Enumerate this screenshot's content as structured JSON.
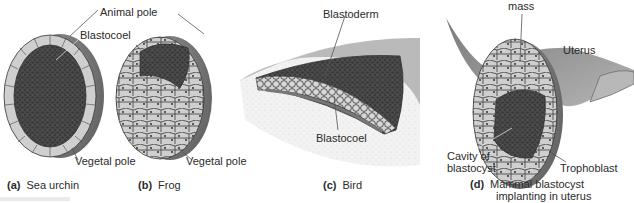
{
  "figure": {
    "panels": [
      {
        "id": "a",
        "caption_letter": "(a)",
        "caption_text": "Sea urchin",
        "labels": {
          "animal_pole": "Animal pole",
          "blastocoel": "Blastocoel",
          "vegetal_pole": "Vegetal pole"
        }
      },
      {
        "id": "b",
        "caption_letter": "(b)",
        "caption_text": "Frog",
        "labels": {
          "vegetal_pole": "Vegetal pole"
        }
      },
      {
        "id": "c",
        "caption_letter": "(c)",
        "caption_text": "Bird",
        "labels": {
          "blastoderm": "Blastoderm",
          "blastocoel": "Blastocoel"
        }
      },
      {
        "id": "d",
        "caption_letter": "(d)",
        "caption_text_line1": "Mammal blastocyst",
        "caption_text_line2": "implanting in uterus",
        "labels": {
          "inner_cell_mass": "mass",
          "uterus": "Uterus",
          "cavity_line1": "Cavity of",
          "cavity_line2": "blastocyst",
          "trophoblast": "Trophoblast"
        }
      }
    ]
  },
  "colors": {
    "shell": "#8c8c8c",
    "cells": "#cfcfcf",
    "interior": "#3c3c3c",
    "uterus": "#9a9a9a",
    "yolk": "#ececec"
  }
}
